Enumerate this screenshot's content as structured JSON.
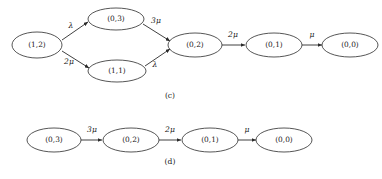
{
  "figure": {
    "width": 382,
    "height": 179,
    "background_color": "#ffffff",
    "stroke_color": "#2b2b2b",
    "text_color": "#1a1a1a"
  },
  "chart_data": {
    "type": "diagram",
    "diagram_kind": "state-transition-rate-diagram",
    "title": "",
    "panels": [
      {
        "caption": "(c)",
        "caption_x": 170,
        "caption_y": 96,
        "nodes": [
          {
            "id": "c-1-2",
            "label": "(1,2)",
            "cx": 37,
            "cy": 45,
            "rx": 25,
            "ry": 13
          },
          {
            "id": "c-0-3",
            "label": "(0,3)",
            "cx": 116,
            "cy": 19,
            "rx": 28,
            "ry": 11
          },
          {
            "id": "c-1-1",
            "label": "(1,1)",
            "cx": 117,
            "cy": 71,
            "rx": 29,
            "ry": 11
          },
          {
            "id": "c-0-2",
            "label": "(0,2)",
            "cx": 195,
            "cy": 45,
            "rx": 27,
            "ry": 12
          },
          {
            "id": "c-0-1",
            "label": "(0,1)",
            "cx": 274,
            "cy": 45,
            "rx": 28,
            "ry": 12
          },
          {
            "id": "c-0-0",
            "label": "(0,0)",
            "cx": 350,
            "cy": 45,
            "rx": 28,
            "ry": 12
          }
        ],
        "edges": [
          {
            "from": "c-1-2",
            "to": "c-0-3",
            "rate": "λ",
            "x1": 62,
            "y1": 40,
            "x2": 88,
            "y2": 22,
            "label_x": 71,
            "label_y": 26
          },
          {
            "from": "c-1-2",
            "to": "c-1-1",
            "rate": "2μ",
            "x1": 62,
            "y1": 51,
            "x2": 89,
            "y2": 68,
            "label_x": 69,
            "label_y": 62
          },
          {
            "from": "c-0-3",
            "to": "c-0-2",
            "rate": "3μ",
            "x1": 143,
            "y1": 24,
            "x2": 170,
            "y2": 41,
            "label_x": 156,
            "label_y": 21
          },
          {
            "from": "c-1-1",
            "to": "c-0-2",
            "rate": "λ",
            "x1": 145,
            "y1": 66,
            "x2": 170,
            "y2": 49,
            "label_x": 155,
            "label_y": 65
          },
          {
            "from": "c-0-2",
            "to": "c-0-1",
            "rate": "2μ",
            "x1": 222,
            "y1": 45,
            "x2": 245,
            "y2": 45,
            "label_x": 233,
            "label_y": 35
          },
          {
            "from": "c-0-1",
            "to": "c-0-0",
            "rate": "μ",
            "x1": 302,
            "y1": 45,
            "x2": 322,
            "y2": 45,
            "label_x": 312,
            "label_y": 35
          }
        ]
      },
      {
        "caption": "(d)",
        "caption_x": 170,
        "caption_y": 162,
        "nodes": [
          {
            "id": "d-0-3",
            "label": "(0,3)",
            "cx": 54,
            "cy": 140,
            "rx": 27,
            "ry": 12
          },
          {
            "id": "d-0-2",
            "label": "(0,2)",
            "cx": 131,
            "cy": 140,
            "rx": 28,
            "ry": 12
          },
          {
            "id": "d-0-1",
            "label": "(0,1)",
            "cx": 210,
            "cy": 140,
            "rx": 28,
            "ry": 12
          },
          {
            "id": "d-0-0",
            "label": "(0,0)",
            "cx": 284,
            "cy": 140,
            "rx": 28,
            "ry": 12
          }
        ],
        "edges": [
          {
            "from": "d-0-3",
            "to": "d-0-2",
            "rate": "3μ",
            "x1": 81,
            "y1": 140,
            "x2": 102,
            "y2": 140,
            "label_x": 92,
            "label_y": 130
          },
          {
            "from": "d-0-2",
            "to": "d-0-1",
            "rate": "2μ",
            "x1": 159,
            "y1": 140,
            "x2": 181,
            "y2": 140,
            "label_x": 170,
            "label_y": 130
          },
          {
            "from": "d-0-1",
            "to": "d-0-0",
            "rate": "μ",
            "x1": 238,
            "y1": 140,
            "x2": 256,
            "y2": 140,
            "label_x": 247,
            "label_y": 130
          }
        ]
      }
    ]
  }
}
